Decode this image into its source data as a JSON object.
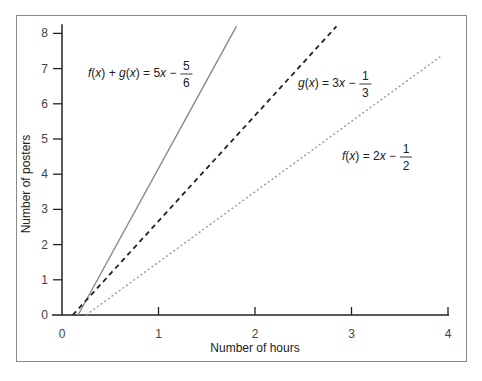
{
  "chart_data": {
    "type": "line",
    "title": "",
    "xlabel": "Number of hours",
    "ylabel": "Number of posters",
    "xlim": [
      0,
      4
    ],
    "ylim": [
      0,
      8.2
    ],
    "xticks": [
      "0",
      "1",
      "2",
      "3",
      "4"
    ],
    "yticks": [
      "0",
      "1",
      "2",
      "3",
      "4",
      "5",
      "6",
      "7",
      "8"
    ],
    "grid": false,
    "legend": "inline annotations",
    "series": [
      {
        "name": "f(x) + g(x) = 5x − 5/6",
        "style": "solid",
        "color": "#888888",
        "slope": 5,
        "intercept": -0.8333,
        "x": [
          0.1667,
          1.807
        ],
        "y": [
          0,
          8.2
        ],
        "label": {
          "lhs": "f(x) + g(x) = 5x −",
          "num": "5",
          "den": "6"
        }
      },
      {
        "name": "g(x) = 3x − 1/3",
        "style": "dashed",
        "color": "#222222",
        "slope": 3,
        "intercept": -0.3333,
        "x": [
          0.1111,
          2.844
        ],
        "y": [
          0,
          8.2
        ],
        "label": {
          "lhs": "g(x) = 3x −",
          "num": "1",
          "den": "3"
        }
      },
      {
        "name": "f(x) = 2x − 1/2",
        "style": "dotted",
        "color": "#999999",
        "slope": 2,
        "intercept": -0.5,
        "x": [
          0.25,
          3.92
        ],
        "y": [
          0,
          7.34
        ],
        "label": {
          "lhs": "f(x) = 2x −",
          "num": "1",
          "den": "2"
        }
      }
    ]
  }
}
